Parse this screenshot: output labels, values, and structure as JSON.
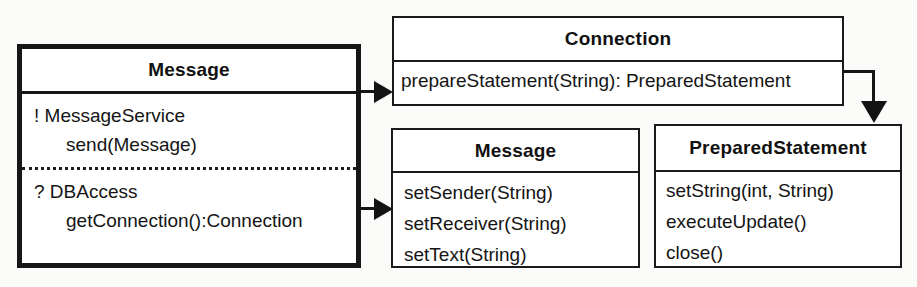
{
  "diagram": {
    "type": "uml-class-diagram",
    "background_color": "#fbfbfa",
    "line_color": "#151515",
    "box_fill": "#ffffff"
  },
  "boxes": {
    "left_message": {
      "title": "Message",
      "compartments": [
        {
          "marker": "!",
          "role": "MessageService",
          "header": "! MessageService",
          "members": [
            "send(Message)"
          ]
        },
        {
          "marker": "?",
          "role": "DBAccess",
          "header": "? DBAccess",
          "members": [
            "getConnection():Connection"
          ]
        }
      ]
    },
    "connection": {
      "title": "Connection",
      "members": [
        "prepareStatement(String): PreparedStatement"
      ]
    },
    "bottom_message": {
      "title": "Message",
      "members": [
        "setSender(String)",
        "setReceiver(String)",
        "setText(String)"
      ]
    },
    "prepared_statement": {
      "title": "PreparedStatement",
      "members": [
        "setString(int, String)",
        "executeUpdate()",
        "close()"
      ]
    }
  },
  "connectors": [
    {
      "name": "message-to-connection",
      "from": "left_message",
      "to": "connection",
      "style": "solid-filled-arrow",
      "direction": "right"
    },
    {
      "name": "message-to-bottom-message",
      "from": "left_message",
      "to": "bottom_message",
      "style": "solid-filled-arrow",
      "direction": "right"
    },
    {
      "name": "connection-to-prepared-statement",
      "from": "connection",
      "to": "prepared_statement",
      "style": "solid-filled-arrow-elbow",
      "direction": "down"
    }
  ]
}
